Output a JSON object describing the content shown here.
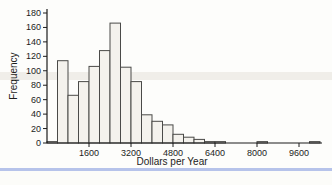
{
  "figure": {
    "background": "#fdfdfb",
    "artifact_band_color": "#d6d0c4",
    "page_edge_color": "#a9b9e6"
  },
  "chart_data": {
    "type": "bar",
    "title": "",
    "xlabel": "Dollars per Year",
    "ylabel": "Frequency",
    "bin_start": 0,
    "bin_width": 400,
    "frequencies": [
      2,
      114,
      66,
      85,
      106,
      128,
      166,
      105,
      85,
      39,
      30,
      25,
      12,
      8,
      5,
      2,
      2,
      0,
      0,
      0,
      2,
      0,
      0,
      0,
      0,
      2
    ],
    "xlim": [
      0,
      10400
    ],
    "ylim": [
      0,
      180
    ],
    "x_ticks": [
      1600,
      3200,
      4800,
      6400,
      8000,
      9600
    ],
    "y_ticks": [
      0,
      20,
      40,
      60,
      80,
      100,
      120,
      140,
      160,
      180
    ],
    "grid": false,
    "legend": null,
    "bar_fill": "#f4f2ed",
    "bar_stroke": "#4a4a48",
    "axis_color": "#1c1c1c",
    "text_color": "#1c1c1c"
  }
}
